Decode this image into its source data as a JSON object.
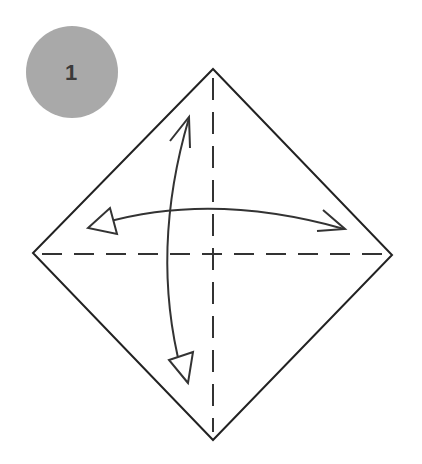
{
  "diagram": {
    "type": "origami-step",
    "step_badge": {
      "number": "1",
      "fill": "#a9a9a9",
      "text_color": "#3a3a3a"
    },
    "square": {
      "orientation": "diamond",
      "vertices": {
        "top": [
          213,
          69
        ],
        "right": [
          392,
          255
        ],
        "bottom": [
          213,
          440
        ],
        "left": [
          33,
          253
        ]
      },
      "stroke": "#222222"
    },
    "fold_lines": [
      {
        "name": "horizontal-valley-fold",
        "style": "dashed"
      },
      {
        "name": "vertical-valley-fold",
        "style": "dashed"
      }
    ],
    "arrows": [
      {
        "name": "horizontal-fold-and-unfold-arrow",
        "direction": "left-right"
      },
      {
        "name": "vertical-fold-and-unfold-arrow",
        "direction": "top-bottom"
      }
    ]
  }
}
